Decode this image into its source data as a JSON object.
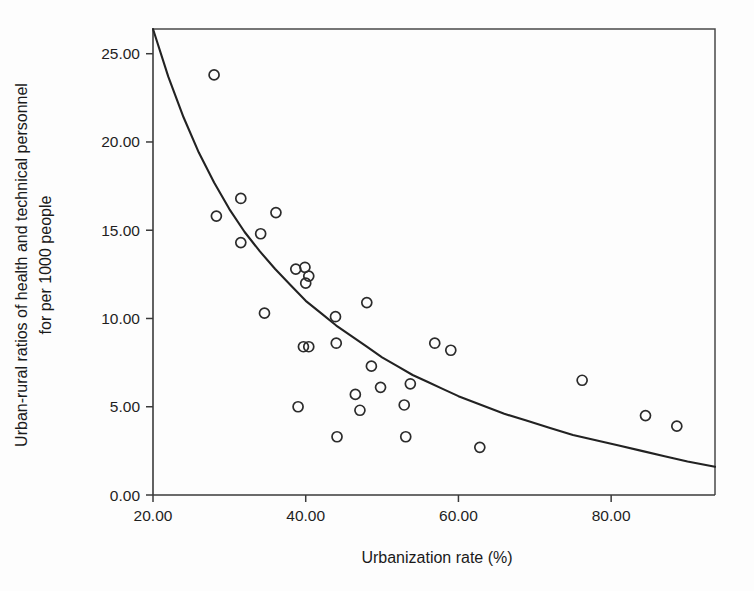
{
  "chart_data": {
    "type": "scatter",
    "title": "",
    "xlabel": "Urbanization rate (%)",
    "ylabel_line1": "Urban-rural ratios of health and technical personnel",
    "ylabel_line2": "for per 1000 people",
    "xlim": [
      20.0,
      93.6
    ],
    "ylim": [
      0.0,
      26.4
    ],
    "xticks": [
      20,
      40,
      60,
      80
    ],
    "yticks": [
      0,
      5,
      10,
      15,
      20,
      25
    ],
    "xticklabels": [
      "20.00",
      "40.00",
      "60.00",
      "80.00"
    ],
    "yticklabels": [
      "0.00",
      "5.00",
      "10.00",
      "15.00",
      "20.00",
      "25.00"
    ],
    "grid": false,
    "legend": null,
    "marker": "open-circle",
    "points": [
      {
        "x": 28.0,
        "y": 23.8
      },
      {
        "x": 28.3,
        "y": 15.8
      },
      {
        "x": 31.5,
        "y": 16.8
      },
      {
        "x": 31.5,
        "y": 14.3
      },
      {
        "x": 34.1,
        "y": 14.8
      },
      {
        "x": 36.1,
        "y": 16.0
      },
      {
        "x": 34.6,
        "y": 10.3
      },
      {
        "x": 38.7,
        "y": 12.8
      },
      {
        "x": 39.9,
        "y": 12.9
      },
      {
        "x": 40.4,
        "y": 12.4
      },
      {
        "x": 40.0,
        "y": 12.0
      },
      {
        "x": 39.0,
        "y": 5.0
      },
      {
        "x": 39.7,
        "y": 8.4
      },
      {
        "x": 40.4,
        "y": 8.4
      },
      {
        "x": 43.9,
        "y": 10.1
      },
      {
        "x": 44.0,
        "y": 8.6
      },
      {
        "x": 44.1,
        "y": 3.3
      },
      {
        "x": 46.5,
        "y": 5.7
      },
      {
        "x": 47.1,
        "y": 4.8
      },
      {
        "x": 48.0,
        "y": 10.9
      },
      {
        "x": 48.6,
        "y": 7.3
      },
      {
        "x": 49.8,
        "y": 6.1
      },
      {
        "x": 52.9,
        "y": 5.1
      },
      {
        "x": 53.7,
        "y": 6.3
      },
      {
        "x": 53.1,
        "y": 3.3
      },
      {
        "x": 56.9,
        "y": 8.6
      },
      {
        "x": 59.0,
        "y": 8.2
      },
      {
        "x": 62.8,
        "y": 2.7
      },
      {
        "x": 76.2,
        "y": 6.5
      },
      {
        "x": 84.5,
        "y": 4.5
      },
      {
        "x": 88.6,
        "y": 3.9
      }
    ],
    "fit_curve": {
      "description": "decreasing power-law trend line",
      "points": [
        {
          "x": 20.0,
          "y": 26.4
        },
        {
          "x": 22.0,
          "y": 23.7
        },
        {
          "x": 24.0,
          "y": 21.4
        },
        {
          "x": 26.0,
          "y": 19.4
        },
        {
          "x": 28.0,
          "y": 17.7
        },
        {
          "x": 30.0,
          "y": 16.2
        },
        {
          "x": 32.0,
          "y": 14.9
        },
        {
          "x": 34.0,
          "y": 13.8
        },
        {
          "x": 36.0,
          "y": 12.8
        },
        {
          "x": 38.0,
          "y": 11.9
        },
        {
          "x": 40.0,
          "y": 11.0
        },
        {
          "x": 42.0,
          "y": 10.3
        },
        {
          "x": 44.0,
          "y": 9.6
        },
        {
          "x": 46.0,
          "y": 9.0
        },
        {
          "x": 48.0,
          "y": 8.4
        },
        {
          "x": 50.0,
          "y": 7.8
        },
        {
          "x": 52.0,
          "y": 7.3
        },
        {
          "x": 54.0,
          "y": 6.8
        },
        {
          "x": 56.0,
          "y": 6.4
        },
        {
          "x": 58.0,
          "y": 6.0
        },
        {
          "x": 60.0,
          "y": 5.6
        },
        {
          "x": 63.0,
          "y": 5.1
        },
        {
          "x": 66.0,
          "y": 4.6
        },
        {
          "x": 69.0,
          "y": 4.2
        },
        {
          "x": 72.0,
          "y": 3.8
        },
        {
          "x": 75.0,
          "y": 3.4
        },
        {
          "x": 78.0,
          "y": 3.1
        },
        {
          "x": 81.0,
          "y": 2.8
        },
        {
          "x": 84.0,
          "y": 2.5
        },
        {
          "x": 87.0,
          "y": 2.2
        },
        {
          "x": 90.0,
          "y": 1.9
        },
        {
          "x": 93.6,
          "y": 1.6
        }
      ]
    }
  },
  "colors": {
    "background": "#fdfdfd",
    "axis": "#3a3a3a",
    "marker": "#2b2b2b",
    "curve": "#222222",
    "text": "#1a1a1a"
  }
}
